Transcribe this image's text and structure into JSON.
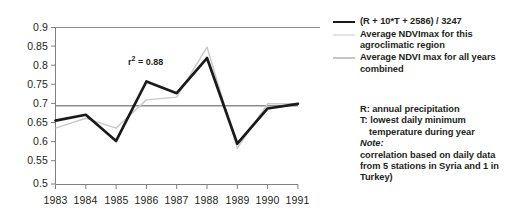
{
  "chart_data": {
    "type": "line",
    "title": "",
    "xlabel": "",
    "ylabel": "",
    "categories": [
      "1983",
      "1984",
      "1985",
      "1986",
      "1987",
      "1988",
      "1989",
      "1990",
      "1991"
    ],
    "ylim": [
      0.5,
      0.9
    ],
    "ytick_labels": [
      "0.9",
      "0.85",
      "0.8",
      "0.75",
      "0.7",
      "0.65",
      "0.6",
      "0.55",
      "0.5"
    ],
    "ytick_values": [
      0.9,
      0.85,
      0.8,
      0.75,
      0.7,
      0.65,
      0.6,
      0.55,
      0.5
    ],
    "grid": false,
    "legend_position": "right",
    "series": [
      {
        "name": "(R + 10*T + 2586) / 3247",
        "color": "#1a1a1a",
        "style": "thick-black",
        "values": [
          0.662,
          0.677,
          0.61,
          0.762,
          0.732,
          0.822,
          0.603,
          0.693,
          0.705
        ]
      },
      {
        "name": "Average NDVImax for this agroclimatic region",
        "color": "#c9c9c9",
        "style": "thin-light-gray",
        "values": [
          0.643,
          0.668,
          0.643,
          0.715,
          0.722,
          0.85,
          0.592,
          0.705,
          0.705
        ]
      },
      {
        "name": "Average NDVI max for all years combined",
        "color": "#8d8d8d",
        "style": "thin-medium-gray-horizontal",
        "values": [
          0.7,
          0.7,
          0.7,
          0.7,
          0.7,
          0.7,
          0.7,
          0.7,
          0.7
        ]
      }
    ],
    "annotations": [
      {
        "text": "r2 = 0.88",
        "display_base": "r",
        "display_sup": "2",
        "display_rest": " = 0.88",
        "x": "1986",
        "y": 0.792
      }
    ]
  },
  "legend": {
    "items": [
      {
        "label": "(R + 10*T + 2586) / 3247",
        "swatch": "black-thick"
      },
      {
        "label": "Average NDVImax for this agroclimatic region",
        "swatch": "gray-light"
      },
      {
        "label": "Average NDVI max for all years combined",
        "swatch": "gray-medium"
      }
    ]
  },
  "notes": {
    "line_r": "R: annual precipitation",
    "line_t": "T: lowest daily minimum",
    "line_t_cont": "temperature during year",
    "note_label": "Note:",
    "note_line1": "correlation based on daily data",
    "note_line2": "from 5 stations in Syria and 1 in",
    "note_line3": "Turkey)"
  }
}
